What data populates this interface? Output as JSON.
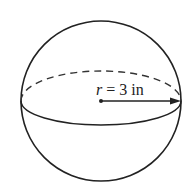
{
  "diagram": {
    "type": "sphere",
    "radius_label_var": "r",
    "radius_label_rest": " = 3 in",
    "radius_value": 3,
    "radius_unit": "in",
    "stroke_color": "#222222"
  }
}
